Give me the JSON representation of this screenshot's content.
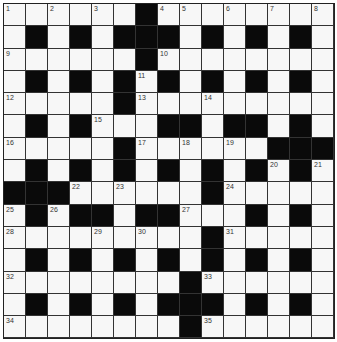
{
  "puzzle": {
    "rows": 15,
    "cols": 15,
    "colors": {
      "white": "#f7f7f7",
      "black": "#0a0a0a",
      "line": "#333333"
    },
    "grid": [
      "......#........",
      ".#.#.###.#.#.#.",
      "......#........",
      ".#.#.#.#.#.#.#.",
      ".....#.........",
      ".#.#...##.##.#.",
      ".....#......###",
      ".#.#.#.#.#.#.#.",
      "###......#.....",
      ".#.##.##...#.#.",
      ".........#.....",
      ".#.#.#.#.#.#.#.",
      "........#......",
      ".#.#.#.###.#.#.",
      "........#......"
    ],
    "numbers": [
      {
        "r": 0,
        "c": 0,
        "n": "1"
      },
      {
        "r": 0,
        "c": 2,
        "n": "2"
      },
      {
        "r": 0,
        "c": 4,
        "n": "3"
      },
      {
        "r": 0,
        "c": 7,
        "n": "4"
      },
      {
        "r": 0,
        "c": 8,
        "n": "5"
      },
      {
        "r": 0,
        "c": 10,
        "n": "6"
      },
      {
        "r": 0,
        "c": 12,
        "n": "7"
      },
      {
        "r": 0,
        "c": 14,
        "n": "8"
      },
      {
        "r": 2,
        "c": 0,
        "n": "9"
      },
      {
        "r": 2,
        "c": 7,
        "n": "10"
      },
      {
        "r": 3,
        "c": 6,
        "n": "11"
      },
      {
        "r": 4,
        "c": 0,
        "n": "12"
      },
      {
        "r": 4,
        "c": 6,
        "n": "13"
      },
      {
        "r": 4,
        "c": 9,
        "n": "14"
      },
      {
        "r": 5,
        "c": 4,
        "n": "15"
      },
      {
        "r": 6,
        "c": 0,
        "n": "16"
      },
      {
        "r": 6,
        "c": 6,
        "n": "17"
      },
      {
        "r": 6,
        "c": 8,
        "n": "18"
      },
      {
        "r": 6,
        "c": 10,
        "n": "19"
      },
      {
        "r": 7,
        "c": 12,
        "n": "20"
      },
      {
        "r": 7,
        "c": 14,
        "n": "21"
      },
      {
        "r": 8,
        "c": 3,
        "n": "22"
      },
      {
        "r": 8,
        "c": 5,
        "n": "23"
      },
      {
        "r": 8,
        "c": 10,
        "n": "24"
      },
      {
        "r": 9,
        "c": 0,
        "n": "25"
      },
      {
        "r": 9,
        "c": 2,
        "n": "26"
      },
      {
        "r": 9,
        "c": 8,
        "n": "27"
      },
      {
        "r": 10,
        "c": 0,
        "n": "28"
      },
      {
        "r": 10,
        "c": 4,
        "n": "29"
      },
      {
        "r": 10,
        "c": 6,
        "n": "30"
      },
      {
        "r": 10,
        "c": 10,
        "n": "31"
      },
      {
        "r": 12,
        "c": 0,
        "n": "32"
      },
      {
        "r": 12,
        "c": 9,
        "n": "33"
      },
      {
        "r": 14,
        "c": 0,
        "n": "34"
      },
      {
        "r": 14,
        "c": 9,
        "n": "35"
      }
    ]
  }
}
